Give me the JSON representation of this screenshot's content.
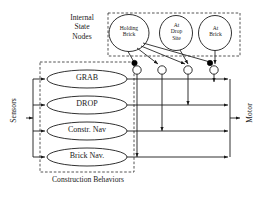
{
  "diagram": {
    "title_region_label": "Internal\nState\nNodes",
    "internal_state_label_lines": [
      "Internal",
      "State",
      "Nodes"
    ],
    "footer_label": "Construction Behaviors",
    "left_io_label": "Sensors",
    "right_io_label": "Motor",
    "internal_state_nodes": [
      {
        "id": "holding-brick",
        "lines": [
          "Holding",
          "Brick"
        ],
        "cx": 129,
        "cy": 33,
        "rx": 20,
        "ry": 18
      },
      {
        "id": "at-drop-site",
        "lines": [
          "At",
          "Drop",
          "Site"
        ],
        "cx": 176,
        "cy": 33,
        "rx": 16.5,
        "ry": 17
      },
      {
        "id": "at-brick",
        "lines": [
          "At",
          "Brick"
        ],
        "cx": 215,
        "cy": 33,
        "rx": 16.5,
        "ry": 17
      }
    ],
    "behaviors": [
      {
        "id": "grab",
        "label": "GRAB",
        "cy": 79
      },
      {
        "id": "drop",
        "label": "DROP",
        "cy": 105
      },
      {
        "id": "constr-nav",
        "label": "Constr. Nav",
        "cy": 131
      },
      {
        "id": "brick-nav",
        "label": "Brick Nav.",
        "cy": 157
      }
    ],
    "suppressor_nodes": [
      {
        "id": "suppressor-1",
        "cx": 137,
        "cy": 70,
        "filled_marker": true
      },
      {
        "id": "suppressor-2",
        "cx": 162,
        "cy": 70,
        "filled_marker": false
      },
      {
        "id": "suppressor-3",
        "cx": 188,
        "cy": 70,
        "filled_marker": false
      },
      {
        "id": "suppressor-4",
        "cx": 214,
        "cy": 70,
        "filled_marker": true
      }
    ],
    "colors": {
      "stroke": "#1a1a1a",
      "dashed": "#2a2a2a",
      "fill": "#ffffff",
      "marker_filled": "#000000",
      "background": "#ffffff"
    }
  }
}
